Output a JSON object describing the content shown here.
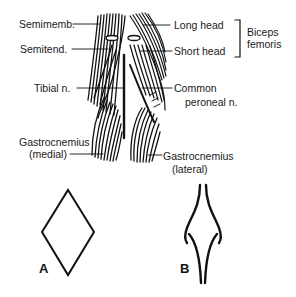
{
  "labels": {
    "semimemb": "Semimemb.",
    "semitend": "Semitend.",
    "tibial": "Tibial n.",
    "gastroc_medial_1": "Gastrocnemius",
    "gastroc_medial_2": "(medial)",
    "long_head": "Long head",
    "short_head": "Short head",
    "biceps_1": "Biceps",
    "biceps_2": "femoris",
    "common_1": "Common",
    "common_2": "peroneal n.",
    "gastroc_lateral_1": "Gastrocnemius",
    "gastroc_lateral_2": "(lateral)"
  },
  "figures": {
    "a_label": "A",
    "b_label": "B",
    "a_shape": "diamond",
    "b_shape": "pinched-diamond"
  },
  "colors": {
    "ink": "#111111",
    "background": "#ffffff"
  }
}
